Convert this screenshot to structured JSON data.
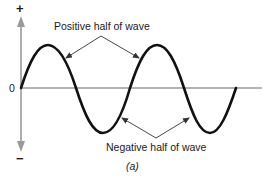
{
  "diagram": {
    "type": "sine-wave",
    "axis": {
      "plus_label": "+",
      "minus_label": "−",
      "zero_label": "0"
    },
    "labels": {
      "positive": "Positive half of wave",
      "negative": "Negative half of wave"
    },
    "caption": "(a)",
    "colors": {
      "wave": "#111111",
      "axis": "#9a9a9a",
      "pointer": "#333333",
      "text": "#1a1a1a"
    },
    "wave": {
      "cycles": 2,
      "peaks": [
        [
          48,
          45
        ],
        [
          157,
          45
        ]
      ],
      "troughs": [
        [
          102,
          133
        ],
        [
          209,
          133
        ]
      ],
      "zero_crossings": [
        21,
        76,
        131,
        183,
        236
      ]
    }
  }
}
